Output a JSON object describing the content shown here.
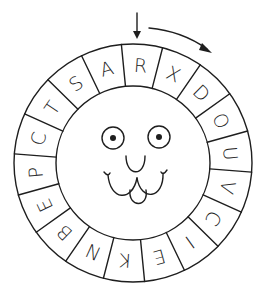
{
  "puzzle": {
    "title": "Cipher wheel with face",
    "start_pointer": "down-arrow",
    "direction": "clockwise",
    "letters": [
      "R",
      "X",
      "D",
      "O",
      "U",
      "V",
      "C",
      "I",
      "E",
      "K",
      "N",
      "B",
      "E",
      "P",
      "C",
      "T",
      "S",
      "A"
    ]
  },
  "geometry": {
    "cx": 133,
    "cy": 163,
    "outer_r": 119,
    "inner_r": 77,
    "letter_r": 98,
    "start_angle_deg": 4.4,
    "segment_deg": 20
  },
  "face": {
    "eyes": [
      {
        "cx": 113,
        "cy": 138,
        "r": 11,
        "pupil_r": 3
      },
      {
        "cx": 159,
        "cy": 137,
        "r": 11,
        "pupil_r": 3
      }
    ]
  },
  "colors": {
    "ink": "#1e1e1e",
    "background": "#ffffff"
  }
}
